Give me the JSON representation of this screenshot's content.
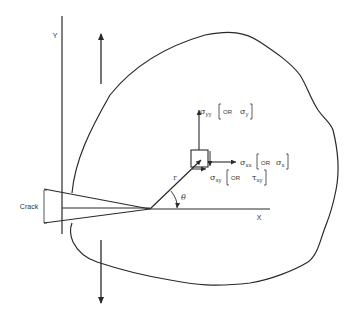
{
  "diagram": {
    "title": "",
    "colors": {
      "stroke": "#2a2a2a",
      "text": "#333333",
      "background": "#ffffff"
    },
    "axes": {
      "x_label": "X",
      "y_label": "Y"
    },
    "crack_label": "Crack",
    "polar": {
      "r_label": "r",
      "theta_label": "θ"
    },
    "stresses": {
      "syy": {
        "symbol": "σ",
        "sub": "yy",
        "or_text": "OR",
        "alt_symbol": "σ",
        "alt_sub": "y"
      },
      "sxx": {
        "symbol": "σ",
        "sub": "xx",
        "or_text": "OR",
        "alt_symbol": "σ",
        "alt_sub": "x"
      },
      "sxy": {
        "symbol": "σ",
        "sub": "xy",
        "or_text": "OR",
        "alt_symbol": "τ",
        "alt_sub": "xy"
      }
    },
    "loads": {
      "top_arrow": "upward remote load",
      "bottom_arrow": "downward remote load"
    }
  }
}
